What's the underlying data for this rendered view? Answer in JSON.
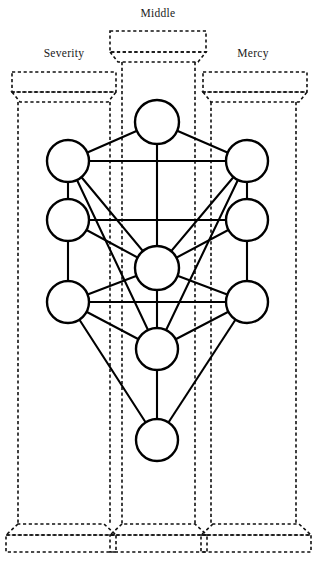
{
  "diagram": {
    "background_color": "#ffffff",
    "stroke_color": "#000000",
    "dashed_color": "#111111",
    "node_fill": "#ffffff"
  },
  "pillars": [
    {
      "id": "severity",
      "label": "Severity",
      "label_x": 64,
      "label_y": 56,
      "capital": {
        "rect_x": 12,
        "rect_y": 72,
        "rect_w": 104,
        "rect_h": 20,
        "trap_h": 10,
        "trap_inset": 8
      },
      "shafts": [
        18,
        110
      ],
      "base": {
        "rect_x": 6,
        "rect_y": 535,
        "rect_w": 110,
        "rect_h": 17,
        "trap_h": 11,
        "trap_inset": 12
      }
    },
    {
      "id": "middle",
      "label": "Middle",
      "label_x": 158,
      "label_y": 16,
      "capital": {
        "rect_x": 110,
        "rect_y": 31,
        "rect_w": 96,
        "rect_h": 21,
        "trap_h": 10,
        "trap_inset": 8
      },
      "shafts": [
        122,
        195
      ],
      "base": {
        "rect_x": 110,
        "rect_y": 535,
        "rect_w": 97,
        "rect_h": 17,
        "trap_h": 11,
        "trap_inset": 12
      }
    },
    {
      "id": "mercy",
      "label": "Mercy",
      "label_x": 253,
      "label_y": 56,
      "capital": {
        "rect_x": 203,
        "rect_y": 72,
        "rect_w": 104,
        "rect_h": 20,
        "trap_h": 10,
        "trap_inset": 8
      },
      "shafts": [
        211,
        296
      ],
      "base": {
        "rect_x": 201,
        "rect_y": 535,
        "rect_w": 110,
        "rect_h": 17,
        "trap_h": 11,
        "trap_inset": 12
      }
    }
  ],
  "chart_data": {
    "type": "diagram",
    "node_count": 10,
    "path_count": 22,
    "nodes": [
      {
        "id": "n1",
        "name": "top-center",
        "column": "middle",
        "x": 157,
        "y": 122,
        "r": 22
      },
      {
        "id": "n2",
        "name": "upper-left",
        "column": "severity",
        "x": 68,
        "y": 161,
        "r": 21
      },
      {
        "id": "n3",
        "name": "upper-right",
        "column": "mercy",
        "x": 247,
        "y": 161,
        "r": 21
      },
      {
        "id": "n4",
        "name": "middle-upper-left",
        "column": "severity",
        "x": 68,
        "y": 220,
        "r": 21
      },
      {
        "id": "n5",
        "name": "middle-upper-right",
        "column": "mercy",
        "x": 247,
        "y": 220,
        "r": 21
      },
      {
        "id": "n6",
        "name": "center",
        "column": "middle",
        "x": 157,
        "y": 268,
        "r": 22
      },
      {
        "id": "n7",
        "name": "lower-left",
        "column": "severity",
        "x": 68,
        "y": 302,
        "r": 21
      },
      {
        "id": "n8",
        "name": "lower-right",
        "column": "mercy",
        "x": 247,
        "y": 302,
        "r": 21
      },
      {
        "id": "n9",
        "name": "lower-center",
        "column": "middle",
        "x": 157,
        "y": 349,
        "r": 21
      },
      {
        "id": "n10",
        "name": "bottom-center",
        "column": "middle",
        "x": 157,
        "y": 440,
        "r": 21
      }
    ],
    "edges": [
      [
        "n1",
        "n2"
      ],
      [
        "n1",
        "n3"
      ],
      [
        "n1",
        "n6"
      ],
      [
        "n2",
        "n3"
      ],
      [
        "n2",
        "n4"
      ],
      [
        "n3",
        "n5"
      ],
      [
        "n2",
        "n6"
      ],
      [
        "n3",
        "n6"
      ],
      [
        "n2",
        "n9"
      ],
      [
        "n3",
        "n9"
      ],
      [
        "n4",
        "n5"
      ],
      [
        "n4",
        "n6"
      ],
      [
        "n5",
        "n6"
      ],
      [
        "n4",
        "n7"
      ],
      [
        "n5",
        "n8"
      ],
      [
        "n6",
        "n7"
      ],
      [
        "n6",
        "n8"
      ],
      [
        "n6",
        "n9"
      ],
      [
        "n7",
        "n8"
      ],
      [
        "n7",
        "n9"
      ],
      [
        "n8",
        "n9"
      ],
      [
        "n7",
        "n10"
      ],
      [
        "n8",
        "n10"
      ],
      [
        "n9",
        "n10"
      ]
    ]
  }
}
